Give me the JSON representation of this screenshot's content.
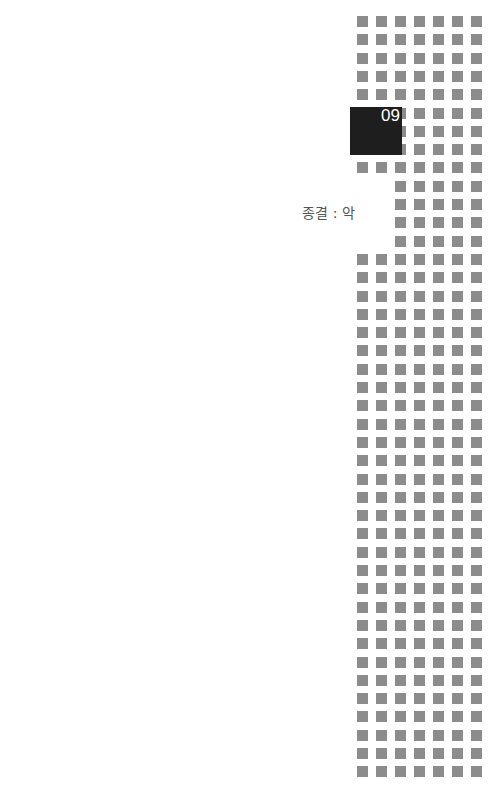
{
  "chapter": {
    "number": "09",
    "title": "종결 : 악"
  },
  "pattern": {
    "columns": 7,
    "rows": 42,
    "origin_x": 357,
    "origin_y": 16,
    "pitch_x": 19,
    "pitch_y": 18.3,
    "square_size": 11,
    "square_color": "#8c8c8c",
    "box_color": "#1e1e1e"
  }
}
